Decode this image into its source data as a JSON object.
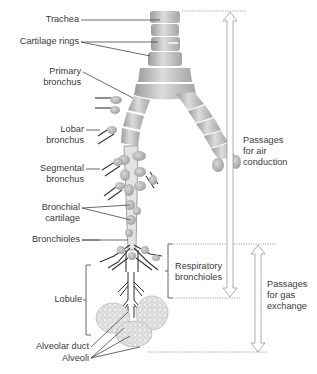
{
  "diagram": {
    "colors": {
      "airway_fill": "#c9c9c9",
      "airway_shade": "#9a9a9a",
      "cartilage_band": "#f2f2f2",
      "alveoli": "#d6d6d6",
      "leader_line": "#444444",
      "arrow_outline": "#9a9a9a",
      "dotted_line": "#8a8a8a",
      "text": "#3a3a3a"
    },
    "left_labels": [
      {
        "id": "trachea",
        "lines": [
          "Trachea"
        ]
      },
      {
        "id": "cartilage-rings",
        "lines": [
          "Cartilage rings"
        ]
      },
      {
        "id": "primary-bronchus",
        "lines": [
          "Primary",
          "bronchus"
        ]
      },
      {
        "id": "lobar-bronchus",
        "lines": [
          "Lobar",
          "bronchus"
        ]
      },
      {
        "id": "segmental-bronchus",
        "lines": [
          "Segmental",
          "bronchus"
        ]
      },
      {
        "id": "bronchial-cartilage",
        "lines": [
          "Bronchial",
          "cartilage"
        ]
      },
      {
        "id": "bronchioles",
        "lines": [
          "Bronchioles"
        ]
      },
      {
        "id": "lobule",
        "lines": [
          "Lobule"
        ]
      },
      {
        "id": "alveolar-duct",
        "lines": [
          "Alveolar duct"
        ]
      },
      {
        "id": "alveoli",
        "lines": [
          "Alveoli"
        ]
      }
    ],
    "right_labels": [
      {
        "id": "respiratory-bronchioles",
        "lines": [
          "Respiratory",
          "bronchioles"
        ]
      },
      {
        "id": "air-conduction",
        "lines": [
          "Passages",
          "for air",
          "conduction"
        ]
      },
      {
        "id": "gas-exchange",
        "lines": [
          "Passages",
          "for gas",
          "exchange"
        ]
      }
    ],
    "zones": [
      {
        "name": "Passages for air conduction",
        "from": "Trachea",
        "to": "Terminal bronchioles"
      },
      {
        "name": "Passages for gas exchange",
        "from": "Respiratory bronchioles",
        "to": "Alveoli"
      }
    ]
  }
}
